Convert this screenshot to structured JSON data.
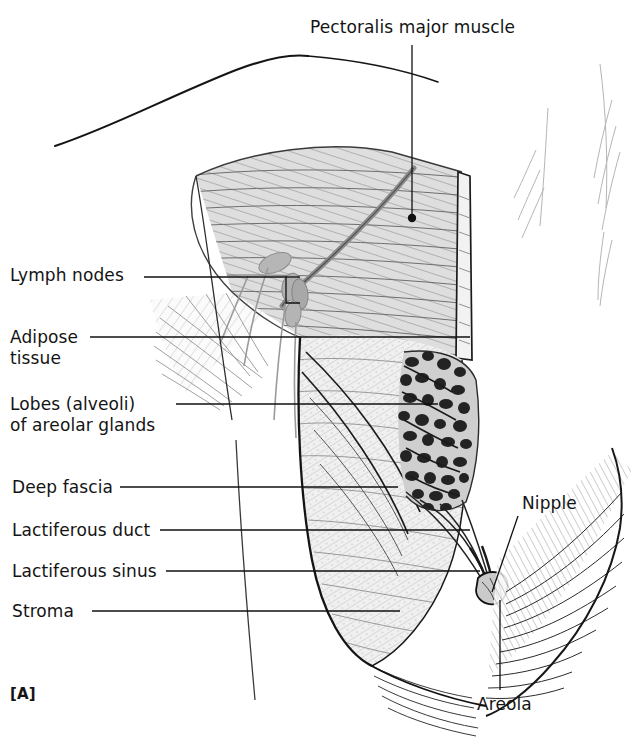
{
  "figure": {
    "panel_label": "[A]",
    "style": "black-and-white anatomical line drawing with hatching"
  },
  "labels": {
    "pectoralis": "Pectoralis major muscle",
    "lymph_nodes": "Lymph nodes",
    "adipose_line1": "Adipose",
    "adipose_line2": "tissue",
    "lobes_line1": "Lobes (alveoli)",
    "lobes_line2": "of areolar glands",
    "deep_fascia": "Deep fascia",
    "lactiferous_duct": "Lactiferous duct",
    "lactiferous_sinus": "Lactiferous sinus",
    "stroma": "Stroma",
    "nipple": "Nipple",
    "areola": "Areola"
  },
  "colors": {
    "ink": "#141414",
    "leader": "#111111",
    "muscle_fill": "#dcdcdc",
    "tissue_fill": "#ededed",
    "gland_fill": "#2a2a2a",
    "node_fill": "#b9b9b9",
    "background": "#ffffff"
  }
}
